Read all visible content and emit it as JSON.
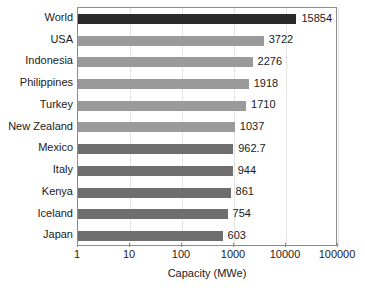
{
  "chart_data": {
    "type": "bar",
    "orientation": "horizontal",
    "title": "",
    "xlabel": "Capacity (MWe)",
    "ylabel": "",
    "xscale": "log",
    "xlim": [
      1,
      100000
    ],
    "xticks": [
      1,
      10,
      100,
      1000,
      10000,
      100000
    ],
    "xtick_labels": [
      "1",
      "10",
      "100",
      "1000",
      "10000",
      "100000"
    ],
    "grid": true,
    "legend": "none",
    "categories": [
      "World",
      "USA",
      "Indonesia",
      "Philippines",
      "Turkey",
      "New Zealand",
      "Mexico",
      "Italy",
      "Kenya",
      "Iceland",
      "Japan"
    ],
    "values": [
      15854,
      3722,
      2276,
      1918,
      1710,
      1037,
      962.7,
      944,
      861,
      754,
      603
    ],
    "value_labels": [
      "15854",
      "3722",
      "2276",
      "1918",
      "1710",
      "1037",
      "962.7",
      "944",
      "861",
      "754",
      "603"
    ],
    "bar_colors": [
      "#2b2b2b",
      "#9a9a9a",
      "#9a9a9a",
      "#9a9a9a",
      "#9a9a9a",
      "#9a9a9a",
      "#6e6e6e",
      "#6e6e6e",
      "#6e6e6e",
      "#6e6e6e",
      "#6e6e6e"
    ]
  },
  "style": {
    "background": "#ffffff",
    "frame_color": "#8c8c8c",
    "grid_color": "#e4e4e4",
    "text_color": "#1a1a1a"
  }
}
